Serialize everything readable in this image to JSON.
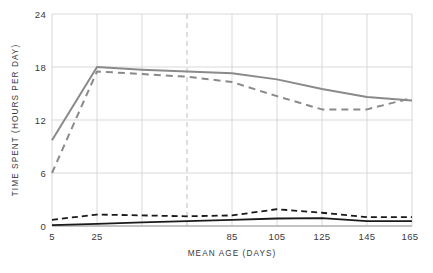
{
  "chart_data": {
    "type": "line",
    "title": "",
    "xlabel": "MEAN AGE (DAYS)",
    "ylabel": "TIME SPENT (HOURS PER DAY)",
    "xlim": [
      5,
      165
    ],
    "ylim": [
      0,
      24
    ],
    "x_ticks": [
      5,
      25,
      45,
      65,
      85,
      105,
      125,
      145,
      165
    ],
    "x_tick_labels": [
      "5",
      "25",
      "",
      "",
      "85",
      "105",
      "125",
      "145",
      "165"
    ],
    "y_ticks": [
      0,
      6,
      12,
      18,
      24
    ],
    "y_tick_labels": [
      "0",
      "6",
      "12",
      "18",
      "24"
    ],
    "grid": true,
    "grid_color": "#d8d8d8",
    "highlight_gridline_x": 65,
    "highlight_gridline_style": "dashed",
    "legend": "none",
    "x": [
      5,
      25,
      45,
      65,
      85,
      105,
      125,
      145,
      165
    ],
    "series": [
      {
        "name": "gray-solid",
        "color": "#8a8a8a",
        "style": "solid",
        "width": 2.0,
        "values": [
          9.7,
          18.0,
          17.7,
          17.5,
          17.3,
          16.6,
          15.5,
          14.6,
          14.2
        ]
      },
      {
        "name": "gray-dashed",
        "color": "#8a8a8a",
        "style": "dashed",
        "width": 2.0,
        "values": [
          6.0,
          17.5,
          17.2,
          16.9,
          16.3,
          14.7,
          13.2,
          13.2,
          14.5
        ]
      },
      {
        "name": "black-dashed",
        "color": "#1a1a1a",
        "style": "dashed",
        "width": 1.8,
        "values": [
          0.7,
          1.3,
          1.2,
          1.1,
          1.2,
          1.9,
          1.5,
          1.0,
          1.0
        ]
      },
      {
        "name": "black-solid",
        "color": "#1a1a1a",
        "style": "solid",
        "width": 1.8,
        "values": [
          0.1,
          0.25,
          0.4,
          0.55,
          0.7,
          0.85,
          0.9,
          0.55,
          0.55
        ]
      }
    ]
  },
  "axes": {
    "y_label": "TIME SPENT (HOURS PER DAY)",
    "x_label": "MEAN AGE (DAYS)"
  },
  "y_ticks": {
    "t0": "0",
    "t1": "6",
    "t2": "12",
    "t3": "18",
    "t4": "24"
  },
  "x_ticks": {
    "t0": "5",
    "t1": "25",
    "t2": "85",
    "t3": "105",
    "t4": "125",
    "t5": "145",
    "t6": "165"
  }
}
